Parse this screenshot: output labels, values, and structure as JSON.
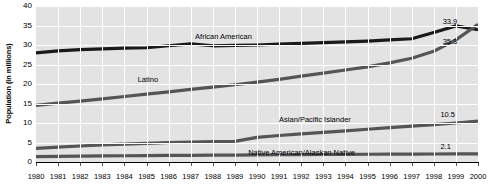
{
  "chart_data": {
    "type": "line",
    "title": "",
    "xlabel": "",
    "ylabel": "Population (in millions)",
    "xlim": [
      1980,
      2000
    ],
    "ylim": [
      0,
      40
    ],
    "yticks": [
      0,
      5,
      10,
      15,
      20,
      25,
      30,
      35,
      40
    ],
    "grid": true,
    "legend_position": "inline-annotations",
    "x": [
      1980,
      1981,
      1982,
      1983,
      1984,
      1985,
      1986,
      1987,
      1988,
      1989,
      1990,
      1991,
      1992,
      1993,
      1994,
      1995,
      1996,
      1997,
      1998,
      1999,
      2000
    ],
    "series": [
      {
        "name": "African American",
        "color": "#1a1a1a",
        "values": [
          28.0,
          28.5,
          28.8,
          29.0,
          29.2,
          29.3,
          29.8,
          30.3,
          29.8,
          29.9,
          30.0,
          30.2,
          30.4,
          30.6,
          30.8,
          31.0,
          31.3,
          31.6,
          33.2,
          34.9,
          33.9
        ],
        "end_label": "33.9"
      },
      {
        "name": "Latino",
        "color": "#555555",
        "values": [
          14.5,
          15.1,
          15.6,
          16.2,
          16.8,
          17.4,
          18.0,
          18.6,
          19.2,
          19.8,
          20.5,
          21.2,
          22.0,
          22.8,
          23.6,
          24.4,
          25.4,
          26.6,
          28.4,
          31.3,
          35.3
        ],
        "end_label": "35.3"
      },
      {
        "name": "Asian/Pacific Islander",
        "color": "#555555",
        "values": [
          3.5,
          3.8,
          4.1,
          4.4,
          4.6,
          4.8,
          5.0,
          5.1,
          5.2,
          5.3,
          6.3,
          6.8,
          7.2,
          7.6,
          8.0,
          8.4,
          8.8,
          9.2,
          9.6,
          10.0,
          10.5
        ],
        "end_label": "10.5"
      },
      {
        "name": "Native American/Alaskan Native",
        "color": "#555555",
        "values": [
          1.4,
          1.45,
          1.5,
          1.55,
          1.6,
          1.65,
          1.7,
          1.72,
          1.75,
          1.78,
          1.82,
          1.86,
          1.9,
          1.93,
          1.96,
          1.99,
          2.0,
          2.02,
          2.05,
          2.08,
          2.1
        ],
        "end_label": "2.1"
      }
    ],
    "annotations": [
      {
        "text": "African American",
        "x": 1987.2,
        "y": 33.2
      },
      {
        "text": "Latino",
        "x": 1984.6,
        "y": 22.0
      },
      {
        "text": "Asian/Pacific Islander",
        "x": 1991.0,
        "y": 11.9
      },
      {
        "text": "Native American/Alaskan Native",
        "x": 1989.6,
        "y": 3.3
      }
    ],
    "value_labels": [
      {
        "text": "33.9",
        "series": "African American",
        "x": 1998.4,
        "y": 37.0
      },
      {
        "text": "35.3",
        "series": "Latino",
        "x": 1998.4,
        "y": 31.8
      },
      {
        "text": "10.5",
        "series": "Asian/Pacific Islander",
        "x": 1998.3,
        "y": 13.0
      },
      {
        "text": "2.1",
        "series": "Native American/Alaskan Native",
        "x": 1998.3,
        "y": 5.0
      }
    ]
  }
}
